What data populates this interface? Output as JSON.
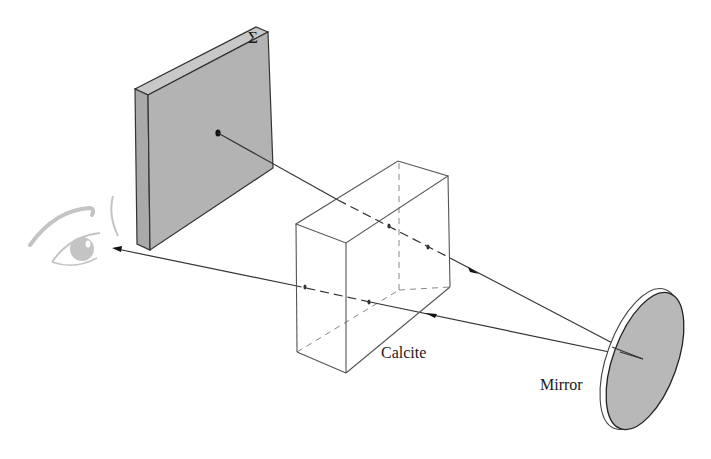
{
  "figure": {
    "labels": {
      "screen": "Σ",
      "crystal": "Calcite",
      "mirror": "Mirror"
    },
    "objects": [
      {
        "name": "screen",
        "description": "grey rectangular screen with point source"
      },
      {
        "name": "calcite",
        "description": "transparent calcite crystal block"
      },
      {
        "name": "mirror",
        "description": "circular mirror, grey disk"
      },
      {
        "name": "eye",
        "description": "observer eye"
      }
    ],
    "rays": [
      {
        "name": "incident-ray",
        "from": "screen point",
        "to": "mirror",
        "direction": "toward mirror"
      },
      {
        "name": "reflected-ray",
        "from": "mirror",
        "to": "eye",
        "direction": "toward eye"
      }
    ],
    "colors": {
      "screen_fill": "#b3b3b3",
      "mirror_fill": "#b8b8b8",
      "line": "#333333",
      "eye": "#c4c4c4"
    }
  }
}
